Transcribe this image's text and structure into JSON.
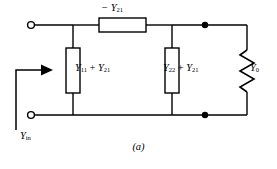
{
  "figure": {
    "caption": "(a)",
    "stroke_color": "#000000",
    "background_color": "#ffffff"
  },
  "labels": {
    "series_element": "− Y21",
    "series_element_base": "− Y",
    "series_element_sub": "21",
    "shunt_left_base_1": "Y",
    "shunt_left_sub_1": "11",
    "shunt_left_operator": " + ",
    "shunt_left_base_2": "Y",
    "shunt_left_sub_2": "21",
    "shunt_left_full": "Y11 + Y21",
    "shunt_right_base_1": "Y",
    "shunt_right_sub_1": "22",
    "shunt_right_operator": " + ",
    "shunt_right_base_2": "Y",
    "shunt_right_sub_2": "21",
    "shunt_right_full": "Y22 + Y21",
    "load_base": "Y",
    "load_sub": "0",
    "load_full": "Y0",
    "input_base": "Y",
    "input_sub": "in",
    "input_full": "Yin"
  },
  "components": {
    "series_box": "series-admittance-box",
    "shunt_box_left": "shunt-admittance-box-left",
    "shunt_box_right": "shunt-admittance-box-right",
    "load_resistor": "zigzag-load-resistor",
    "terminal_top": "open-terminal-top-left",
    "terminal_bottom": "open-terminal-bottom-left",
    "node_top": "junction-dot-top-right",
    "node_bottom": "junction-dot-bottom-right",
    "input_arrow": "input-admittance-arrow"
  }
}
